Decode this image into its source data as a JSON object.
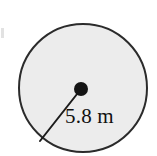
{
  "figure": {
    "kind": "geometry-diagram",
    "background_color": "#ffffff"
  },
  "circle": {
    "name": "circle-shape",
    "center_x": 83,
    "center_y": 88,
    "radius_px": 64,
    "fill_color": "#ececec",
    "stroke_color": "#2b2b2b",
    "stroke_width": 2
  },
  "center_point": {
    "name": "center-dot",
    "x": 81,
    "y": 89,
    "radius_px": 7,
    "color": "#141414"
  },
  "radius_segment": {
    "name": "radius-line",
    "from_x": 81,
    "from_y": 89,
    "to_x": 40,
    "to_y": 141,
    "stroke_color": "#1c1c1c",
    "stroke_width": 2,
    "label": "5.8 m",
    "value": 5.8,
    "unit": "m"
  },
  "labels": {
    "radius_text": "5.8 m"
  },
  "artifacts": {
    "left_edge_mark": "scan-artifact"
  }
}
